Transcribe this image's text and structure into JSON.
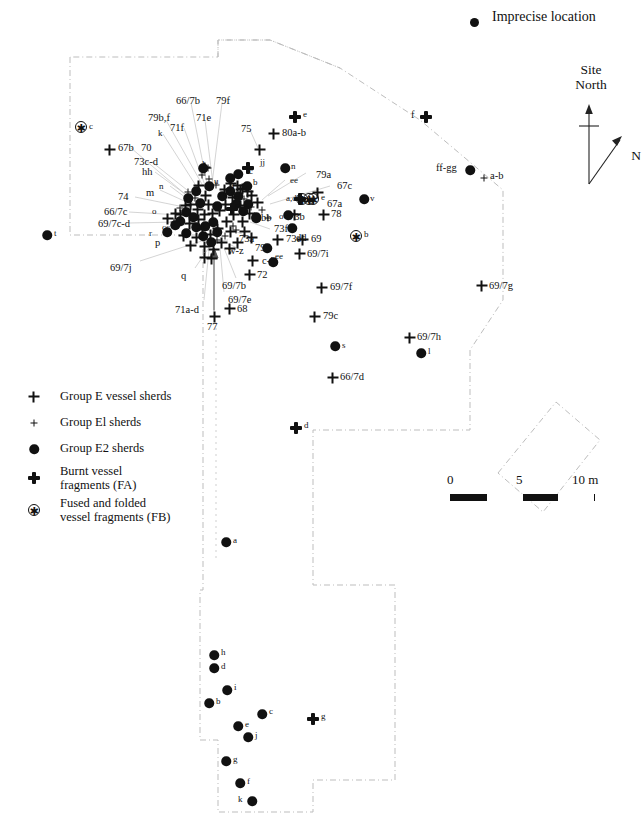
{
  "figure": {
    "type": "archaeological-distribution-map",
    "title": "",
    "background": "#ffffff",
    "ink": "#111111"
  },
  "key_imprecise": {
    "label": "Imprecise location",
    "marker": "filled-circle"
  },
  "north_arrow": {
    "site_north_line1": "Site",
    "site_north_line2": "North",
    "true_north_label": "N"
  },
  "scalebar": {
    "ticks": [
      "0",
      "5",
      "10 m"
    ],
    "unit": "m",
    "segments": [
      "on",
      "off",
      "on",
      "off"
    ],
    "max_value": 10
  },
  "legend": {
    "items": [
      {
        "marker": "plus-large",
        "label": "Group E vessel sherds",
        "lines": [
          "Group E vessel sherds"
        ]
      },
      {
        "marker": "plus-small",
        "label": "Group E1 sherds",
        "lines": [
          "Group El sherds"
        ]
      },
      {
        "marker": "dot",
        "label": "Group E2 sherds",
        "lines": [
          "Group E2 sherds"
        ]
      },
      {
        "marker": "fa-cross",
        "label": "Burnt vessel fragments (FA)",
        "lines": [
          "Burnt vessel",
          "fragments (FA)"
        ]
      },
      {
        "marker": "fb-star",
        "label": "Fused and folded vessel fragments (FB)",
        "lines": [
          "Fused and folded",
          "vessel fragments (FB)"
        ]
      }
    ]
  },
  "chart_data": {
    "type": "scatter",
    "xlabel": "",
    "ylabel": "",
    "grid": false,
    "legend_position": "lower-left",
    "series": [
      {
        "name": "Group E vessel sherds",
        "marker": "plus-large"
      },
      {
        "name": "Group E1 sherds",
        "marker": "plus-small"
      },
      {
        "name": "Group E2 sherds",
        "marker": "dot"
      },
      {
        "name": "Burnt vessel fragments (FA)",
        "marker": "fa-cross"
      },
      {
        "name": "Fused and folded vessel fragments (FB)",
        "marker": "fb-star"
      }
    ],
    "points": [
      {
        "id": "fb-c",
        "marker": "fb-star",
        "x": 81,
        "y": 127,
        "label": "c",
        "lx": 90,
        "ly": 122
      },
      {
        "id": "p-67b",
        "marker": "plus-large",
        "x": 110,
        "y": 150,
        "label": "67b",
        "lx": 118,
        "ly": 144
      },
      {
        "id": "fa-e",
        "marker": "fa-cross",
        "x": 295,
        "y": 117,
        "label": "e",
        "lx": 304,
        "ly": 110
      },
      {
        "id": "p-80ab",
        "marker": "plus-large",
        "x": 274,
        "y": 134,
        "label": "80a-b",
        "lx": 282,
        "ly": 128
      },
      {
        "id": "fa-f",
        "marker": "fa-cross",
        "x": 426,
        "y": 117,
        "label": "f",
        "lx": 411,
        "ly": 110
      },
      {
        "id": "d-ffgg",
        "marker": "dot",
        "x": 470,
        "y": 170,
        "label": "ff-gg",
        "lx": 437,
        "ly": 164
      },
      {
        "id": "p-ab",
        "marker": "plus-small",
        "x": 484,
        "y": 178,
        "label": "a-b",
        "lx": 490,
        "ly": 172
      },
      {
        "id": "d-t",
        "marker": "dot",
        "x": 47,
        "y": 235,
        "label": "t",
        "lx": 54,
        "ly": 230
      },
      {
        "id": "p-71e-t",
        "marker": "plus-large",
        "x": 205,
        "y": 168,
        "label": "",
        "lx": 0,
        "ly": 0
      },
      {
        "id": "d-n",
        "marker": "dot",
        "x": 285,
        "y": 168,
        "label": "n",
        "lx": 292,
        "ly": 163
      },
      {
        "id": "d-v",
        "marker": "dot",
        "x": 364,
        "y": 199,
        "label": "v",
        "lx": 371,
        "ly": 194
      },
      {
        "id": "fb-b",
        "marker": "fb-star",
        "x": 356,
        "y": 236,
        "label": "b",
        "lx": 364,
        "ly": 230
      },
      {
        "id": "p-78",
        "marker": "plus-large",
        "x": 324,
        "y": 215,
        "label": "78",
        "lx": 332,
        "ly": 210
      },
      {
        "id": "p-69",
        "marker": "plus-large",
        "x": 303,
        "y": 240,
        "label": "69",
        "lx": 311,
        "ly": 235
      },
      {
        "id": "p-697i",
        "marker": "plus-large",
        "x": 300,
        "y": 254,
        "label": "69/7i",
        "lx": 308,
        "ly": 249
      },
      {
        "id": "p-697f",
        "marker": "plus-large",
        "x": 322,
        "y": 288,
        "label": "69/7f",
        "lx": 331,
        "ly": 283
      },
      {
        "id": "p-697g",
        "marker": "plus-large",
        "x": 482,
        "y": 286,
        "label": "69/7g",
        "lx": 490,
        "ly": 281
      },
      {
        "id": "p-79c",
        "marker": "plus-large",
        "x": 315,
        "y": 317,
        "label": "79c",
        "lx": 324,
        "ly": 312
      },
      {
        "id": "d-s",
        "marker": "dot",
        "x": 335,
        "y": 346,
        "label": "s",
        "lx": 342,
        "ly": 341
      },
      {
        "id": "p-697h",
        "marker": "plus-large",
        "x": 410,
        "y": 338,
        "label": "69/7h",
        "lx": 418,
        "ly": 333
      },
      {
        "id": "d-l",
        "marker": "dot",
        "x": 421,
        "y": 353,
        "label": "l",
        "lx": 428,
        "ly": 348
      },
      {
        "id": "p-667d",
        "marker": "plus-large",
        "x": 333,
        "y": 378,
        "label": "66/7d",
        "lx": 341,
        "ly": 373
      },
      {
        "id": "fa-d",
        "marker": "fa-cross",
        "x": 296,
        "y": 428,
        "label": "d",
        "lx": 305,
        "ly": 422
      },
      {
        "id": "d-a",
        "marker": "dot",
        "x": 226,
        "y": 542,
        "label": "a",
        "lx": 234,
        "ly": 537
      },
      {
        "id": "d-h",
        "marker": "dot",
        "x": 214,
        "y": 655,
        "label": "h",
        "lx": 222,
        "ly": 650
      },
      {
        "id": "d-d",
        "marker": "dot",
        "x": 214,
        "y": 668,
        "label": "d",
        "lx": 222,
        "ly": 664
      },
      {
        "id": "d-i",
        "marker": "dot",
        "x": 227,
        "y": 690,
        "label": "i",
        "lx": 235,
        "ly": 685
      },
      {
        "id": "d-b",
        "marker": "dot",
        "x": 209,
        "y": 703,
        "label": "b",
        "lx": 217,
        "ly": 699
      },
      {
        "id": "d-c2",
        "marker": "dot",
        "x": 262,
        "y": 714,
        "label": "c",
        "lx": 270,
        "ly": 709
      },
      {
        "id": "fa-g",
        "marker": "fa-cross",
        "x": 313,
        "y": 719,
        "label": "g",
        "lx": 322,
        "ly": 713
      },
      {
        "id": "d-e2",
        "marker": "dot",
        "x": 238,
        "y": 726,
        "label": "e",
        "lx": 246,
        "ly": 722
      },
      {
        "id": "d-j",
        "marker": "dot",
        "x": 248,
        "y": 737,
        "label": "j",
        "lx": 256,
        "ly": 733
      },
      {
        "id": "d-g2",
        "marker": "dot",
        "x": 226,
        "y": 761,
        "label": "g",
        "lx": 234,
        "ly": 757
      },
      {
        "id": "d-f2",
        "marker": "dot",
        "x": 240,
        "y": 783,
        "label": "f",
        "lx": 248,
        "ly": 778
      },
      {
        "id": "d-k",
        "marker": "dot",
        "x": 252,
        "y": 801,
        "label": "k",
        "lx": 240,
        "ly": 797
      },
      {
        "id": "p-77",
        "marker": "plus-large",
        "x": 215,
        "y": 317,
        "label": "77",
        "lx": 208,
        "ly": 322
      },
      {
        "id": "p-68",
        "marker": "plus-large",
        "x": 230,
        "y": 309,
        "label": "68",
        "lx": 238,
        "ly": 305
      },
      {
        "id": "p-72",
        "marker": "plus-large",
        "x": 250,
        "y": 275,
        "label": "72",
        "lx": 258,
        "ly": 271
      },
      {
        "id": "p-cj",
        "marker": "plus-large",
        "x": 253,
        "y": 261,
        "label": "c-j",
        "lx": 261,
        "ly": 257
      },
      {
        "id": "d-ee3",
        "marker": "dot",
        "x": 273,
        "y": 262,
        "label": "ee",
        "lx": 278,
        "ly": 255
      },
      {
        "id": "d-79e",
        "marker": "dot",
        "x": 267,
        "y": 248,
        "label": "79e",
        "lx": 257,
        "ly": 243
      },
      {
        "id": "p-73e",
        "marker": "plus-large",
        "x": 278,
        "y": 240,
        "label": "73e",
        "lx": 286,
        "ly": 235
      },
      {
        "id": "d-dd",
        "marker": "dot",
        "x": 292,
        "y": 228,
        "label": "dd",
        "lx": 297,
        "ly": 237
      },
      {
        "id": "p-73b",
        "marker": "plus-large",
        "x": 295,
        "y": 215,
        "label": "73b",
        "lx": 280,
        "ly": 213
      },
      {
        "id": "d-o2",
        "marker": "dot",
        "x": 288,
        "y": 215,
        "label": "o",
        "lx": 280,
        "ly": 213
      },
      {
        "id": "fb-ad",
        "marker": "fb-star",
        "x": 309,
        "y": 199,
        "label": "e",
        "lx": 322,
        "ly": 194
      },
      {
        "id": "p-67a",
        "marker": "plus-large",
        "x": 318,
        "y": 193,
        "label": "67a",
        "lx": 327,
        "ly": 200
      },
      {
        "id": "d-bb",
        "marker": "dot",
        "x": 256,
        "y": 218,
        "label": "bb",
        "lx": 262,
        "ly": 216
      },
      {
        "id": "p-b",
        "marker": "plus-large",
        "x": 243,
        "y": 189,
        "label": "b",
        "lx": 250,
        "ly": 185
      },
      {
        "id": "d-jj",
        "marker": "dot",
        "x": 238,
        "y": 174,
        "label": "jj",
        "lx": 260,
        "ly": 159
      },
      {
        "id": "p-75",
        "marker": "plus-large",
        "x": 260,
        "y": 150,
        "label": "75",
        "lx": 242,
        "ly": 131
      }
    ]
  },
  "labels": {
    "top_cluster": [
      {
        "text": "66/7b",
        "x": 176,
        "y": 96,
        "size": "md"
      },
      {
        "text": "79f",
        "x": 216,
        "y": 96,
        "size": "md"
      },
      {
        "text": "79b,f",
        "x": 148,
        "y": 113,
        "size": "md"
      },
      {
        "text": "71e",
        "x": 196,
        "y": 113,
        "size": "md"
      },
      {
        "text": "71f",
        "x": 170,
        "y": 123,
        "size": "md"
      },
      {
        "text": "k",
        "x": 158,
        "y": 129,
        "size": "sm"
      },
      {
        "text": "75",
        "x": 241,
        "y": 124,
        "size": "md"
      },
      {
        "text": "80a-b",
        "x": 282,
        "y": 128,
        "size": "md"
      },
      {
        "text": "e",
        "x": 303,
        "y": 110,
        "size": "sm"
      },
      {
        "text": "c",
        "x": 89,
        "y": 122,
        "size": "sm"
      },
      {
        "text": "67b",
        "x": 118,
        "y": 143,
        "size": "md"
      },
      {
        "text": "70",
        "x": 141,
        "y": 143,
        "size": "md"
      },
      {
        "text": "73c-d",
        "x": 134,
        "y": 157,
        "size": "md"
      },
      {
        "text": "hh",
        "x": 142,
        "y": 167,
        "size": "md"
      },
      {
        "text": "l",
        "x": 202,
        "y": 160,
        "size": "sm"
      },
      {
        "text": "jj",
        "x": 260,
        "y": 158,
        "size": "sm"
      },
      {
        "text": "n",
        "x": 291,
        "y": 162,
        "size": "sm"
      },
      {
        "text": "u",
        "x": 214,
        "y": 177,
        "size": "sm"
      },
      {
        "text": "c",
        "x": 249,
        "y": 167,
        "size": "sm"
      },
      {
        "text": "b",
        "x": 253,
        "y": 178,
        "size": "sm"
      },
      {
        "text": "ee",
        "x": 290,
        "y": 176,
        "size": "sm"
      },
      {
        "text": "79a",
        "x": 316,
        "y": 170,
        "size": "md"
      },
      {
        "text": "67c",
        "x": 337,
        "y": 181,
        "size": "md"
      },
      {
        "text": "74",
        "x": 118,
        "y": 192,
        "size": "md"
      },
      {
        "text": "m",
        "x": 146,
        "y": 188,
        "size": "md"
      },
      {
        "text": "n",
        "x": 159,
        "y": 182,
        "size": "sm"
      },
      {
        "text": "f",
        "x": 232,
        "y": 182,
        "size": "sm"
      },
      {
        "text": "a,d",
        "x": 286,
        "y": 194,
        "size": "sm"
      },
      {
        "text": "e",
        "x": 321,
        "y": 193,
        "size": "sm"
      },
      {
        "text": "67a",
        "x": 327,
        "y": 199,
        "size": "md"
      },
      {
        "text": "v",
        "x": 370,
        "y": 194,
        "size": "sm"
      },
      {
        "text": "66/7c",
        "x": 104,
        "y": 207,
        "size": "md"
      },
      {
        "text": "o",
        "x": 152,
        "y": 207,
        "size": "sm"
      },
      {
        "text": "a",
        "x": 237,
        "y": 196,
        "size": "sm"
      },
      {
        "text": "bb",
        "x": 261,
        "y": 213,
        "size": "md"
      },
      {
        "text": "o",
        "x": 279,
        "y": 212,
        "size": "sm"
      },
      {
        "text": "73b",
        "x": 289,
        "y": 212,
        "size": "md"
      },
      {
        "text": "78",
        "x": 331,
        "y": 209,
        "size": "md"
      },
      {
        "text": "69/7c-d",
        "x": 98,
        "y": 219,
        "size": "md"
      },
      {
        "text": "r",
        "x": 149,
        "y": 229,
        "size": "sm"
      },
      {
        "text": "cc",
        "x": 162,
        "y": 223,
        "size": "sm"
      },
      {
        "text": "73f",
        "x": 274,
        "y": 224,
        "size": "md"
      },
      {
        "text": "dd",
        "x": 296,
        "y": 233,
        "size": "md"
      },
      {
        "text": "73e",
        "x": 286,
        "y": 234,
        "size": "md"
      },
      {
        "text": "69",
        "x": 311,
        "y": 234,
        "size": "md"
      },
      {
        "text": "b",
        "x": 364,
        "y": 230,
        "size": "sm"
      },
      {
        "text": "t",
        "x": 54,
        "y": 229,
        "size": "sm"
      },
      {
        "text": "p",
        "x": 155,
        "y": 238,
        "size": "md"
      },
      {
        "text": "73a",
        "x": 239,
        "y": 234,
        "size": "md"
      },
      {
        "text": "w-z",
        "x": 228,
        "y": 246,
        "size": "md"
      },
      {
        "text": "79e",
        "x": 255,
        "y": 243,
        "size": "md"
      },
      {
        "text": "ee",
        "x": 275,
        "y": 252,
        "size": "sm"
      },
      {
        "text": "69/7i",
        "x": 307,
        "y": 249,
        "size": "md"
      },
      {
        "text": "c-j",
        "x": 262,
        "y": 256,
        "size": "md"
      },
      {
        "text": "69/7j",
        "x": 110,
        "y": 263,
        "size": "md"
      },
      {
        "text": "q",
        "x": 181,
        "y": 271,
        "size": "md"
      },
      {
        "text": "72",
        "x": 257,
        "y": 270,
        "size": "md"
      },
      {
        "text": "69/7b",
        "x": 222,
        "y": 281,
        "size": "md"
      },
      {
        "text": "69/7e",
        "x": 228,
        "y": 295,
        "size": "md"
      },
      {
        "text": "71a-d",
        "x": 175,
        "y": 305,
        "size": "md"
      },
      {
        "text": "68",
        "x": 237,
        "y": 304,
        "size": "md"
      },
      {
        "text": "77",
        "x": 207,
        "y": 322,
        "size": "md"
      },
      {
        "text": "f",
        "x": 411,
        "y": 110,
        "size": "md"
      },
      {
        "text": "ff-gg",
        "x": 436,
        "y": 163,
        "size": "md"
      },
      {
        "text": "a-b",
        "x": 490,
        "y": 171,
        "size": "md"
      },
      {
        "text": "69/7f",
        "x": 330,
        "y": 282,
        "size": "md"
      },
      {
        "text": "69/7g",
        "x": 489,
        "y": 281,
        "size": "md"
      },
      {
        "text": "79c",
        "x": 323,
        "y": 311,
        "size": "md"
      },
      {
        "text": "s",
        "x": 342,
        "y": 341,
        "size": "sm"
      },
      {
        "text": "69/7h",
        "x": 417,
        "y": 332,
        "size": "md"
      },
      {
        "text": "l",
        "x": 428,
        "y": 347,
        "size": "sm"
      },
      {
        "text": "66/7d",
        "x": 340,
        "y": 372,
        "size": "md"
      },
      {
        "text": "d",
        "x": 304,
        "y": 421,
        "size": "sm"
      },
      {
        "text": "a",
        "x": 233,
        "y": 536,
        "size": "sm"
      },
      {
        "text": "h",
        "x": 221,
        "y": 648,
        "size": "sm"
      },
      {
        "text": "d",
        "x": 221,
        "y": 662,
        "size": "sm"
      },
      {
        "text": "i",
        "x": 234,
        "y": 683,
        "size": "sm"
      },
      {
        "text": "b",
        "x": 216,
        "y": 697,
        "size": "sm"
      },
      {
        "text": "c",
        "x": 269,
        "y": 707,
        "size": "sm"
      },
      {
        "text": "e",
        "x": 245,
        "y": 720,
        "size": "sm"
      },
      {
        "text": "g",
        "x": 321,
        "y": 712,
        "size": "sm"
      },
      {
        "text": "j",
        "x": 255,
        "y": 731,
        "size": "sm"
      },
      {
        "text": "g",
        "x": 233,
        "y": 755,
        "size": "sm"
      },
      {
        "text": "f",
        "x": 247,
        "y": 777,
        "size": "sm"
      },
      {
        "text": "k",
        "x": 238,
        "y": 795,
        "size": "sm"
      }
    ]
  }
}
